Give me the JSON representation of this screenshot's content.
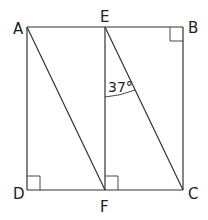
{
  "diagram": {
    "title": "",
    "points": {
      "A": "A",
      "B": "B",
      "C": "C",
      "D": "D",
      "E": "E",
      "F": "F"
    },
    "segments": [
      "AB",
      "BC",
      "CD",
      "DA",
      "EF",
      "AF",
      "EC"
    ],
    "right_angles": [
      "B",
      "D",
      "F"
    ],
    "angle_label": "37°",
    "angle_at": "E",
    "angle_between": [
      "EF",
      "EC"
    ]
  }
}
